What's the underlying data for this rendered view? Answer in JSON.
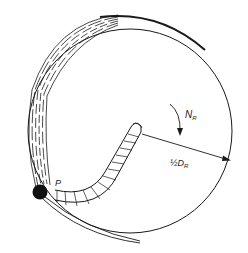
{
  "figure": {
    "labels": {
      "rotation": "N",
      "rotation_sub": "R",
      "radius_prefix": "½D",
      "radius_sub": "R",
      "point": "P"
    },
    "colors": {
      "line": "#1a1a1a",
      "background": "#ffffff"
    }
  }
}
